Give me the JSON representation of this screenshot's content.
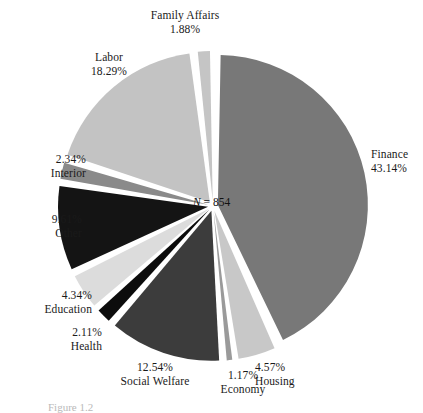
{
  "figure": {
    "center_note_var": "N",
    "center_note_eq": " = ",
    "center_note_value": "854",
    "bottom_caption": "Figure 1.2"
  },
  "chart_data": {
    "type": "pie",
    "title": "",
    "total_label": "N = 854",
    "total": 854,
    "units": "percent",
    "exploded": true,
    "start_angle_deg": 0,
    "direction": "clockwise",
    "legend": "none",
    "labels_position": "outside",
    "categories": [
      "Finance",
      "Housing",
      "Economy",
      "Social Welfare",
      "Health",
      "Education",
      "Other",
      "Interior",
      "Labor",
      "Family Affairs"
    ],
    "values": [
      43.14,
      4.57,
      1.17,
      12.54,
      2.11,
      4.34,
      9.61,
      2.34,
      18.29,
      1.88
    ],
    "slices": [
      {
        "name": "Finance",
        "percent": 43.14,
        "percent_label": "43.14%",
        "color": "#787878",
        "label_align": "left",
        "label_x": 371,
        "label_y": 148,
        "order": 1
      },
      {
        "name": "Housing",
        "percent": 4.57,
        "percent_label": "4.57%",
        "color": "#c8c8c8",
        "label_align": "left",
        "label_x": 255,
        "label_y": 361,
        "order": 2
      },
      {
        "name": "Economy",
        "percent": 1.17,
        "percent_label": "1.17%",
        "color": "#9a9a9a",
        "label_align": "center",
        "label_x": 193,
        "label_y": 369,
        "order": 3
      },
      {
        "name": "Social Welfare",
        "percent": 12.54,
        "percent_label": "12.54%",
        "color": "#3c3c3c",
        "label_align": "center",
        "label_x": 105,
        "label_y": 361,
        "order": 4
      },
      {
        "name": "Health",
        "percent": 2.11,
        "percent_label": "2.11%",
        "color": "#0c0c0c",
        "label_align": "right",
        "label_x": 32,
        "label_y": 326,
        "order": 5
      },
      {
        "name": "Education",
        "percent": 4.34,
        "percent_label": "4.34%",
        "color": "#dcdcdc",
        "label_align": "right",
        "label_x": 22,
        "label_y": 289,
        "order": 6
      },
      {
        "name": "Other",
        "percent": 9.61,
        "percent_label": "9.61%",
        "color": "#141414",
        "label_align": "right",
        "label_x": 12,
        "label_y": 213,
        "order": 7
      },
      {
        "name": "Interior",
        "percent": 2.34,
        "percent_label": "2.34%",
        "color": "#8a8a8a",
        "label_align": "right",
        "label_x": 16,
        "label_y": 153,
        "order": 8
      },
      {
        "name": "Labor",
        "percent": 18.29,
        "percent_label": "18.29%",
        "color": "#c3c3c3",
        "label_align": "center",
        "label_x": 59,
        "label_y": 51,
        "order": 9
      },
      {
        "name": "Family Affairs",
        "percent": 1.88,
        "percent_label": "1.88%",
        "color": "#c5c5c5",
        "label_align": "center",
        "label_x": 135,
        "label_y": 9,
        "order": 10
      }
    ],
    "geometry": {
      "cx": 213,
      "cy": 206,
      "r": 150,
      "gap_deg": 2.1,
      "explode_px": 5
    }
  }
}
